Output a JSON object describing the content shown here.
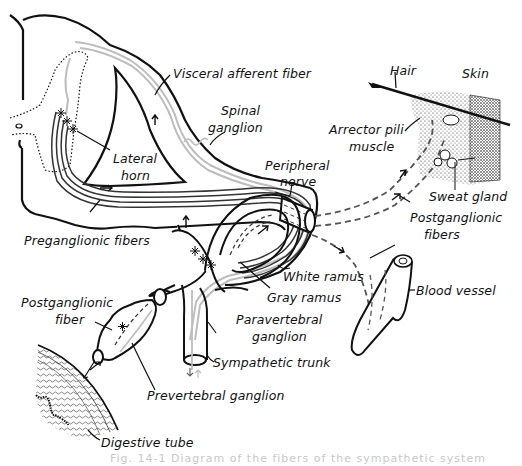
{
  "diagram": {
    "type": "anatomical-diagram",
    "colors": {
      "ink": "#111111",
      "afferent_fiber": "#bdbdbd",
      "background": "#ffffff",
      "caption": "#c8c8c8"
    },
    "labels": {
      "visceral_afferent_fiber": "Visceral afferent fiber",
      "spinal_ganglion_1": "Spinal",
      "spinal_ganglion_2": "ganglion",
      "lateral_horn_1": "Lateral",
      "lateral_horn_2": "horn",
      "preganglionic_fibers": "Preganglionic fibers",
      "peripheral_nerve_1": "Peripheral",
      "peripheral_nerve_2": "nerve",
      "hair": "Hair",
      "skin": "Skin",
      "arrector_pili_1": "Arrector pili",
      "arrector_pili_2": "muscle",
      "sweat_gland": "Sweat gland",
      "postganglionic_fibers_1": "Postganglionic",
      "postganglionic_fibers_2": "fibers",
      "white_ramus": "White ramus",
      "gray_ramus": "Gray ramus",
      "blood_vessel": "Blood vessel",
      "postganglionic_fiber_1": "Postganglionic",
      "postganglionic_fiber_2": "fiber",
      "paravertebral_ganglion_1": "Paravertebral",
      "paravertebral_ganglion_2": "ganglion",
      "sympathetic_trunk": "Sympathetic trunk",
      "prevertebral_ganglion": "Prevertebral ganglion",
      "digestive_tube": "Digestive tube"
    },
    "caption": "Fig. 14-1  Diagram of the fibers of the sympathetic system"
  }
}
